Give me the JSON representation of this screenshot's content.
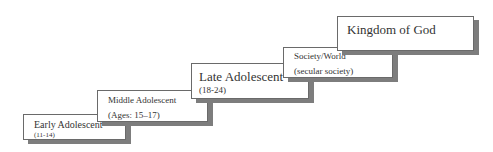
{
  "diagram": {
    "type": "staircase",
    "steps": [
      {
        "title": "Early Adolescent",
        "subtitle": "(11-14)"
      },
      {
        "title": "Middle Adolescent",
        "subtitle": "(Ages: 15–17)"
      },
      {
        "title": "Late Adolescent",
        "subtitle": "(18-24)"
      },
      {
        "title": "Society/World",
        "subtitle": "(secular society)"
      },
      {
        "title": "Kingdom of God"
      }
    ],
    "colors": {
      "border": "#6a6a6a",
      "shadow": "#7d7d7d",
      "background": "#ffffff",
      "text": "#333333"
    }
  }
}
